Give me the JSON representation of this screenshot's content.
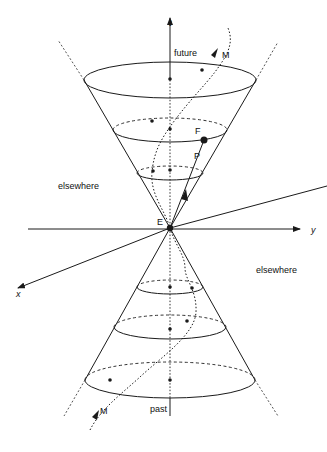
{
  "figure": {
    "axes": {
      "t_label": "t",
      "x_label": "x",
      "y_label": "y"
    },
    "regions": {
      "future_label": "future",
      "past_label": "past",
      "elsewhere_left_label": "elsewhere",
      "elsewhere_right_label": "elsewhere"
    },
    "points": {
      "event_label": "E",
      "future_point_label": "F",
      "path_label": "P",
      "worldline_top_label": "M",
      "worldline_bottom_label": "M"
    },
    "caption_partial": "Light cone with worldline M and event E (caption truncated)",
    "colors": {
      "ink": "#1a1a1a",
      "background": "#ffffff"
    }
  }
}
